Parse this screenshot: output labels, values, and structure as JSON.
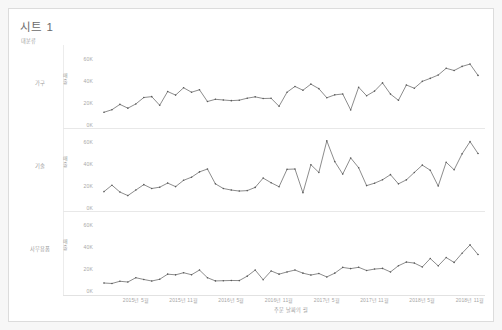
{
  "worksheet": {
    "title": "시트 1",
    "shelf_field_label": "대분류",
    "line_color": "#5a5a5a",
    "text_color": "#9e9e9e",
    "border_color": "#dcdcdc"
  },
  "axes": {
    "y_title": "매출",
    "y_ticks": [
      "60K",
      "40K",
      "20K",
      "0K"
    ],
    "y_values": [
      60000,
      40000,
      20000,
      0
    ],
    "x_title": "주문 날짜의 월",
    "x_ticks": [
      "2015년 5월",
      "2015년 11월",
      "2016년 5월",
      "2016년 11월",
      "2017년 5월",
      "2017년 11월",
      "2018년 5월",
      "2018년 11월"
    ],
    "x_tick_index": [
      4,
      10,
      16,
      22,
      28,
      34,
      40,
      46
    ]
  },
  "panels": [
    {
      "label": "가구"
    },
    {
      "label": "기술"
    },
    {
      "label": "사무용품"
    }
  ],
  "chart_data": {
    "type": "line",
    "title": "시트 1",
    "xlabel": "주문 날짜의 월",
    "ylabel": "매출",
    "ylim": [
      0,
      65000
    ],
    "grid": false,
    "legend": "none",
    "layout": "small-multiples-vertical",
    "x": [
      "2015-01",
      "2015-02",
      "2015-03",
      "2015-04",
      "2015-05",
      "2015-06",
      "2015-07",
      "2015-08",
      "2015-09",
      "2015-10",
      "2015-11",
      "2015-12",
      "2016-01",
      "2016-02",
      "2016-03",
      "2016-04",
      "2016-05",
      "2016-06",
      "2016-07",
      "2016-08",
      "2016-09",
      "2016-10",
      "2016-11",
      "2016-12",
      "2017-01",
      "2017-02",
      "2017-03",
      "2017-04",
      "2017-05",
      "2017-06",
      "2017-07",
      "2017-08",
      "2017-09",
      "2017-10",
      "2017-11",
      "2017-12",
      "2018-01",
      "2018-02",
      "2018-03",
      "2018-04",
      "2018-05",
      "2018-06",
      "2018-07",
      "2018-08",
      "2018-09",
      "2018-10",
      "2018-11",
      "2018-12"
    ],
    "x_tick_labels": [
      "2015년 5월",
      "2015년 11월",
      "2016년 5월",
      "2016년 11월",
      "2017년 5월",
      "2017년 11월",
      "2018년 5월",
      "2018년 11월"
    ],
    "series": [
      {
        "name": "가구",
        "values": [
          11500,
          13800,
          18600,
          15200,
          19000,
          24800,
          25600,
          17800,
          30200,
          27000,
          33600,
          29600,
          31800,
          21200,
          23200,
          22600,
          22000,
          22400,
          24200,
          25400,
          23900,
          24100,
          16900,
          29600,
          34800,
          31400,
          36900,
          32800,
          24600,
          27200,
          28000,
          13600,
          34100,
          26400,
          30600,
          38000,
          27900,
          22300,
          36100,
          33200,
          39400,
          42100,
          45100,
          51200,
          49200,
          52900,
          55000,
          44800
        ]
      },
      {
        "name": "기술",
        "values": [
          14800,
          20600,
          14400,
          11200,
          16200,
          21100,
          17600,
          18800,
          22500,
          19300,
          25000,
          27800,
          32600,
          35200,
          21800,
          17600,
          16200,
          15300,
          15700,
          18600,
          27000,
          22800,
          19200,
          34900,
          35200,
          13700,
          39100,
          32100,
          60600,
          41900,
          30600,
          45200,
          36400,
          20200,
          22400,
          25500,
          30100,
          21800,
          25400,
          32100,
          38700,
          34100,
          19800,
          41300,
          34500,
          48900,
          59900,
          49200
        ]
      },
      {
        "name": "사무용품",
        "values": [
          7200,
          6800,
          8800,
          8100,
          12000,
          10400,
          9000,
          10600,
          15200,
          14600,
          16500,
          14700,
          18900,
          12000,
          9100,
          9300,
          9500,
          9400,
          13400,
          18900,
          10200,
          18100,
          15200,
          17200,
          18900,
          16100,
          14400,
          15800,
          12700,
          16100,
          21300,
          20200,
          21400,
          18500,
          19800,
          20400,
          17200,
          22800,
          26100,
          25200,
          21700,
          29300,
          22700,
          30200,
          25800,
          34100,
          41600,
          32900
        ]
      }
    ]
  }
}
